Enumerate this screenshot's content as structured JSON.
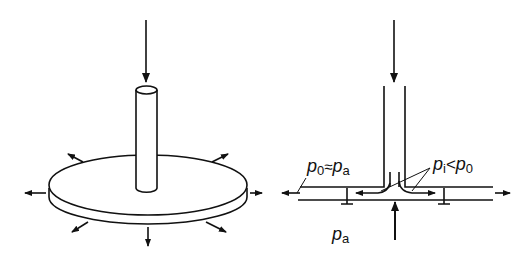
{
  "figure": {
    "left_panel": {
      "description": "3D view of a tube on a circular disk with radial outflow arrows",
      "arrow_count": 8
    },
    "right_panel": {
      "description": "Cross-section of tube over gap between two plates with outflow",
      "labels": {
        "p0_approx_pa": {
          "p": "p",
          "sub0": "0",
          "approx": "≈",
          "p2": "p",
          "sub2": "a"
        },
        "pi_lt_p0": {
          "p": "p",
          "sub_i": "i",
          "lt": "<",
          "p2": "p",
          "sub0": "0"
        },
        "pa": {
          "p": "p",
          "sub": "a"
        }
      }
    },
    "colors": {
      "line": "#111111",
      "background": "#ffffff"
    }
  }
}
